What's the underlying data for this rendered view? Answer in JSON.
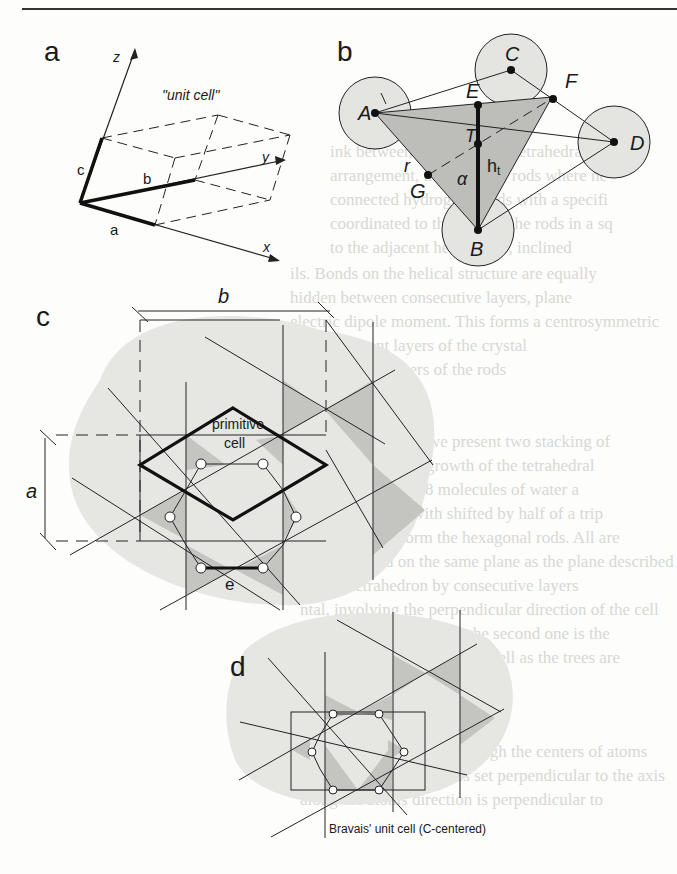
{
  "figure": {
    "panels": [
      {
        "id": "a",
        "label": "a",
        "title": "\"unit cell\"",
        "axes": [
          "x",
          "y",
          "z"
        ],
        "vectors": [
          "a",
          "b",
          "c"
        ]
      },
      {
        "id": "b",
        "label": "b",
        "points": [
          "A",
          "B",
          "C",
          "D",
          "E",
          "F",
          "G",
          "T"
        ],
        "symbols": {
          "length_l": "l",
          "radius": "r",
          "angle": "α",
          "height": "h",
          "height_sub": "t"
        }
      },
      {
        "id": "c",
        "label": "c",
        "dims": {
          "width": "b",
          "height": "a"
        },
        "cell_label_1": "primitive",
        "cell_label_2": "cell",
        "edge_label": "e"
      },
      {
        "id": "d",
        "label": "d",
        "caption": "Bravais' unit cell (C-centered)"
      }
    ]
  },
  "background_text_lines": [
    "ink between the molecular tetrahedra, th",
    "arrangement, in which the rods where ne",
    "connected hydrogen bonds with a specifi",
    "coordinated to the axes of the rods in a sq",
    "to the adjacent helical sets, inclined",
    "ils. Bonds on the helical structure are equally",
    "hidden between consecutive layers, plane",
    "electric dipole moment. This forms a centrosymmetric",
    "to the adjacent layers of the crystal",
    "similar to and others of the rods",
    "",
    "",
    "tal, (see Fig. 2.21) we present two stacking of",
    "water oxygen: the growth of the tetrahedral",
    "ct occupied with 18 molecules of water a",
    "etragonal above with shifted by half of a trip",
    "ad, in order to form the hexagonal rods. All are",
    "d and ordered on the same plane as the plane described",
    "tal, the tetrahedron by consecutive layers",
    "ntal, involving the perpendicular direction of the cell",
    "stack (Bulk with lattice) the second one is the",
    "which form the unit cell as well as the trees are",
    "arrangement",
    "te, of lattice is formed through the centers of atoms",
    "ad to the lattice, which is set perpendicular to the axis",
    "along the atoms direction is perpendicular to"
  ]
}
